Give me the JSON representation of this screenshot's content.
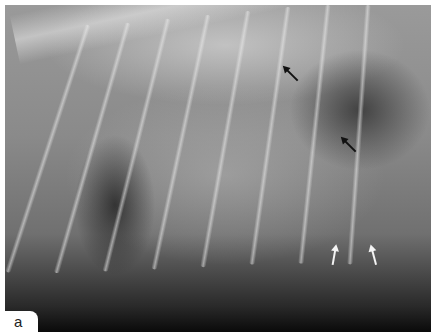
{
  "figure": {
    "panel_label": "a",
    "annotations": [
      {
        "type": "arrow",
        "color": "#111111",
        "x": 291,
        "y": 75,
        "direction": "down-right"
      },
      {
        "type": "arrow",
        "color": "#111111",
        "x": 349,
        "y": 146,
        "direction": "up-left"
      },
      {
        "type": "arrow",
        "color": "#f4f4f4",
        "x": 333,
        "y": 257,
        "direction": "up"
      },
      {
        "type": "arrow",
        "color": "#f4f4f4",
        "x": 373,
        "y": 257,
        "direction": "up"
      }
    ]
  }
}
